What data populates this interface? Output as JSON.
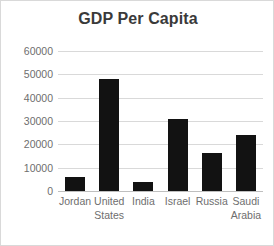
{
  "chart_data": {
    "type": "bar",
    "title": "GDP Per Capita",
    "xlabel": "",
    "ylabel": "",
    "categories": [
      "Jordan",
      "United States",
      "India",
      "Israel",
      "Russia",
      "Saudi Arabia"
    ],
    "values": [
      5800,
      48000,
      3800,
      30800,
      16500,
      23800
    ],
    "ylim": [
      0,
      60000
    ],
    "yticks": [
      "0",
      "10000",
      "20000",
      "30000",
      "40000",
      "50000",
      "60000"
    ],
    "ytick_values": [
      0,
      10000,
      20000,
      30000,
      40000,
      50000,
      60000
    ],
    "grid": true,
    "legend": "none",
    "bar_color": "#121212",
    "grid_color": "#d9d9d9",
    "text_color": "#6e6e6e",
    "title_color": "#3a3a3a"
  }
}
